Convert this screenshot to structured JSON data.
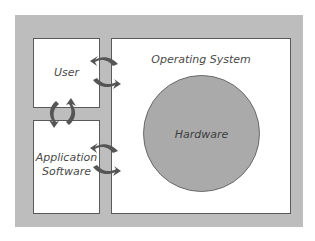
{
  "diagram": {
    "type": "layered-system",
    "components": {
      "user": {
        "label": "User"
      },
      "application": {
        "label_line1": "Application",
        "label_line2": "Software"
      },
      "os": {
        "label": "Operating System"
      },
      "hardware": {
        "label": "Hardware"
      }
    },
    "connections": [
      {
        "from": "user",
        "to": "os",
        "style": "bidirectional-curved-arrows"
      },
      {
        "from": "user",
        "to": "application",
        "style": "bidirectional-curved-arrows"
      },
      {
        "from": "application",
        "to": "os",
        "style": "bidirectional-curved-arrows"
      }
    ],
    "colors": {
      "frame": "#bdbdbd",
      "box_fill": "#ffffff",
      "box_border": "#5a5a5a",
      "hardware_fill": "#aaaaaa",
      "arrow": "#555555",
      "text": "#4a4a4a"
    }
  }
}
